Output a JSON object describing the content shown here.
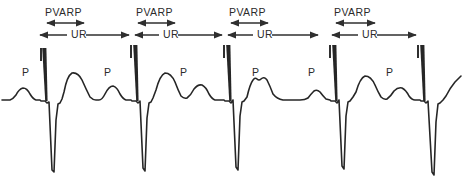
{
  "figure": {
    "background_color": "#ffffff",
    "trace_color": "#262626",
    "annotation_color": "#2f2f2f",
    "width": 463,
    "height": 191
  },
  "labels": {
    "pvarp": "PVARP",
    "ur": "UR",
    "p_wave": "P"
  },
  "chart_data": {
    "type": "line",
    "xlabel": "",
    "ylabel": "",
    "grid": false,
    "legend_position": "none",
    "baseline_y": 100,
    "annotations": [
      {
        "name": "PVARP",
        "index": 0,
        "label": "PVARP",
        "label_x": 45,
        "label_y": 16,
        "arrow_y": 23,
        "x_start": 45,
        "x_end": 86
      },
      {
        "name": "UR",
        "index": 0,
        "label": "UR",
        "label_x": 74,
        "label_y": 38,
        "arrow_y": 35,
        "x_start": 38,
        "x_end": 131
      },
      {
        "name": "PVARP",
        "index": 1,
        "label": "PVARP",
        "label_x": 136,
        "label_y": 16,
        "arrow_y": 23,
        "x_start": 136,
        "x_end": 177
      },
      {
        "name": "UR",
        "index": 1,
        "label": "UR",
        "label_x": 166,
        "label_y": 38,
        "arrow_y": 35,
        "x_start": 133,
        "x_end": 224
      },
      {
        "name": "PVARP",
        "index": 2,
        "label": "PVARP",
        "label_x": 229,
        "label_y": 16,
        "arrow_y": 23,
        "x_start": 227,
        "x_end": 268
      },
      {
        "name": "UR",
        "index": 2,
        "label": "UR",
        "label_x": 260,
        "label_y": 38,
        "arrow_y": 35,
        "x_start": 226,
        "x_end": 320
      },
      {
        "name": "PVARP",
        "index": 3,
        "label": "PVARP",
        "label_x": 334,
        "label_y": 16,
        "arrow_y": 23,
        "x_start": 334,
        "x_end": 377
      },
      {
        "name": "UR",
        "index": 3,
        "label": "UR",
        "label_x": 366,
        "label_y": 38,
        "arrow_y": 35,
        "x_start": 330,
        "x_end": 418
      }
    ],
    "tick_marks": [
      {
        "x": 41,
        "y_top": 48,
        "y_bottom": 61
      },
      {
        "x": 131,
        "y_top": 45,
        "y_bottom": 58
      },
      {
        "x": 224,
        "y_top": 45,
        "y_bottom": 58
      },
      {
        "x": 330,
        "y_top": 45,
        "y_bottom": 58
      },
      {
        "x": 418,
        "y_top": 45,
        "y_bottom": 58
      }
    ],
    "p_wave_labels": [
      {
        "x": 22,
        "y": 76
      },
      {
        "x": 104,
        "y": 76
      },
      {
        "x": 180,
        "y": 76
      },
      {
        "x": 252,
        "y": 76
      },
      {
        "x": 308,
        "y": 76
      },
      {
        "x": 386,
        "y": 76
      }
    ],
    "pacing_spikes": [
      {
        "x": 42,
        "y_top": 48,
        "y_bottom": 101,
        "width": 4.5
      },
      {
        "x": 133,
        "y_top": 45,
        "y_bottom": 101,
        "width": 4.5
      },
      {
        "x": 226,
        "y_top": 45,
        "y_bottom": 101,
        "width": 4.5
      },
      {
        "x": 332,
        "y_top": 45,
        "y_bottom": 101,
        "width": 4.5
      },
      {
        "x": 420,
        "y_top": 45,
        "y_bottom": 101,
        "width": 4.5
      }
    ],
    "series": [
      {
        "name": "ecg-trace",
        "points": "M 2,100 L 10,100 Q 13,99 16,95 Q 19,89 23,88 Q 27,88 30,94 Q 33,99 36,100 L 40,100 L 41,101 L 45,101 L 47,103 L 49,102 L 52,170 L 54,172 L 56,120 L 58,104 L 60,103 L 62,99 L 64,92 Q 67,76 72,73 Q 78,72 82,80 Q 86,89 90,97 Q 93,100 96,100 L 99,100 Q 102,100 105,94 Q 109,86 113,86 Q 117,87 120,94 Q 123,99 126,100 L 131,100 L 132,101 L 136,101 L 138,103 L 140,101 L 143,168 L 145,171 L 147,118 L 149,103 L 151,102 L 153,98 L 156,90 Q 160,75 165,73 Q 171,73 175,82 Q 178,90 181,96 Q 184,99 187,98 Q 191,95 194,89 Q 198,84 202,85 Q 206,87 209,94 Q 212,99 215,100 L 224,100 L 225,101 L 229,101 L 231,103 L 233,100 L 236,167 L 238,170 L 240,116 L 242,102 L 244,101 L 247,97 Q 250,84 253,80 Q 255,77 257,79 Q 259,81 261,79 Q 264,76 267,80 Q 270,86 273,94 Q 277,99 283,100 Q 292,100 300,100 Q 305,100 308,98 Q 311,94 314,91 Q 317,89 320,92 Q 323,96 326,99 L 330,100 L 331,101 L 335,101 L 337,103 L 339,100 L 342,166 L 344,169 L 346,116 L 348,102 L 350,101 L 353,97 L 356,92 Q 360,78 365,76 Q 371,76 375,85 Q 378,92 381,97 Q 384,100 387,99 Q 391,96 394,91 Q 398,87 402,88 Q 406,90 409,96 Q 412,100 415,100 L 420,100 L 421,101 L 424,101 L 426,103 L 428,101 L 432,172 L 434,175 L 436,122 L 438,104 L 440,103 L 443,100 L 446,96 Q 450,88 455,82 L 461,76"
      }
    ]
  }
}
